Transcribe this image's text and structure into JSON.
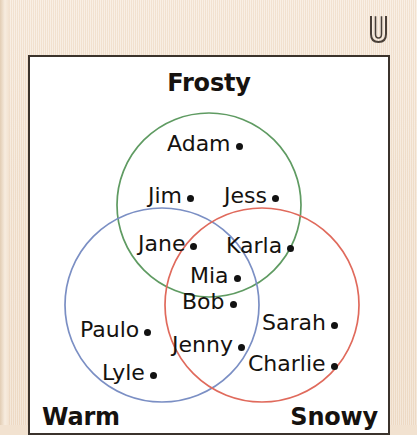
{
  "universe": {
    "symbol_name": "universal-set-symbol",
    "symbol_char": "ᵔC",
    "frame_border_color": "#3b332c",
    "page_background": "#f2e2d0"
  },
  "diagram": {
    "type": "venn",
    "title": "Frosty",
    "sets": [
      {
        "id": "frosty",
        "label": "Frosty",
        "color": "#5f9b62",
        "position": "top-center"
      },
      {
        "id": "warm",
        "label": "Warm",
        "color": "#7b8fc4",
        "position": "bottom-left"
      },
      {
        "id": "snowy",
        "label": "Snowy",
        "color": "#e06a5c",
        "position": "bottom-right"
      }
    ],
    "members": [
      {
        "name": "Adam",
        "regions": [
          "frosty"
        ]
      },
      {
        "name": "Jim",
        "regions": [
          "frosty"
        ]
      },
      {
        "name": "Jess",
        "regions": [
          "frosty"
        ]
      },
      {
        "name": "Jane",
        "regions": [
          "frosty",
          "warm"
        ]
      },
      {
        "name": "Karla",
        "regions": [
          "frosty",
          "snowy"
        ]
      },
      {
        "name": "Mia",
        "regions": [
          "frosty",
          "warm",
          "snowy"
        ]
      },
      {
        "name": "Bob",
        "regions": [
          "frosty",
          "warm",
          "snowy"
        ]
      },
      {
        "name": "Paulo",
        "regions": [
          "warm"
        ]
      },
      {
        "name": "Lyle",
        "regions": [
          "warm"
        ]
      },
      {
        "name": "Jenny",
        "regions": [
          "warm",
          "snowy"
        ]
      },
      {
        "name": "Sarah",
        "regions": [
          "snowy"
        ]
      },
      {
        "name": "Charlie",
        "regions": [
          "snowy"
        ]
      }
    ]
  }
}
